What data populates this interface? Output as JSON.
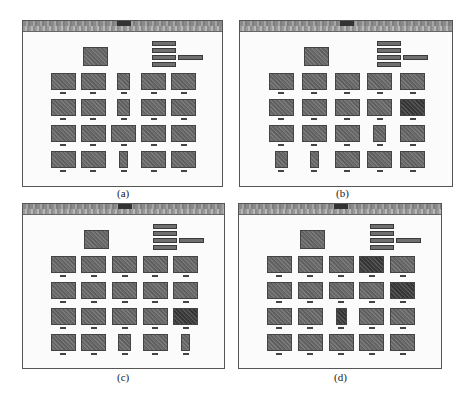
{
  "figure": {
    "captions": [
      "(a)",
      "(b)",
      "(c)",
      "(d)"
    ]
  },
  "panels": [
    {
      "id": "a",
      "window_title": "",
      "buttons": [
        "",
        "",
        "",
        ""
      ],
      "extra_button": "",
      "grid_labels": [
        [
          "",
          "",
          "",
          "",
          ""
        ],
        [
          "",
          "",
          "",
          "",
          ""
        ],
        [
          "",
          "",
          "",
          "",
          ""
        ],
        [
          "",
          "",
          "",
          "",
          ""
        ]
      ]
    },
    {
      "id": "b",
      "window_title": "",
      "buttons": [
        "",
        "",
        "",
        ""
      ],
      "extra_button": "",
      "grid_labels": [
        [
          "",
          "",
          "",
          "",
          ""
        ],
        [
          "",
          "",
          "",
          "",
          ""
        ],
        [
          "",
          "",
          "",
          "",
          ""
        ],
        [
          "",
          "",
          "",
          "",
          ""
        ]
      ]
    },
    {
      "id": "c",
      "window_title": "",
      "buttons": [
        "",
        "",
        "",
        ""
      ],
      "extra_button": "",
      "grid_labels": [
        [
          "",
          "",
          "",
          "",
          ""
        ],
        [
          "",
          "",
          "",
          "",
          ""
        ],
        [
          "",
          "",
          "",
          "",
          ""
        ],
        [
          "",
          "",
          "",
          "",
          ""
        ]
      ]
    },
    {
      "id": "d",
      "window_title": "",
      "buttons": [
        "",
        "",
        "",
        ""
      ],
      "extra_button": "",
      "grid_labels": [
        [
          "",
          "",
          "",
          "",
          ""
        ],
        [
          "",
          "",
          "",
          "",
          ""
        ],
        [
          "",
          "",
          "",
          "",
          ""
        ],
        [
          "",
          "",
          "",
          "",
          ""
        ]
      ]
    }
  ],
  "colors": {
    "titlebar": "#8a8a8a",
    "thumbnail": "#6a6a6a",
    "button": "#6f6f6f",
    "window_bg": "#fbfbfb"
  }
}
